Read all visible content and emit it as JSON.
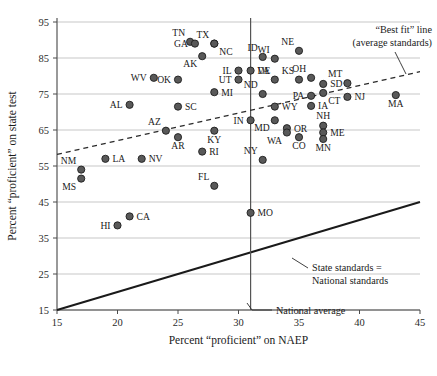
{
  "chart_data": {
    "type": "scatter",
    "title": "",
    "xlabel": "Percent “proficient” on NAEP",
    "ylabel": "Percent “proficient” on state test",
    "xlim": [
      15,
      45
    ],
    "ylim": [
      15,
      95
    ],
    "xticks": [
      15,
      20,
      25,
      30,
      35,
      40,
      45
    ],
    "yticks": [
      15,
      25,
      35,
      45,
      55,
      65,
      75,
      85,
      95
    ],
    "grid": true,
    "legend": "none",
    "national_average_x": 31,
    "points": [
      {
        "label": "TN",
        "x": 26.0,
        "y": 89.5,
        "label_pos": "upper-left"
      },
      {
        "label": "GA",
        "x": 26.4,
        "y": 89.0,
        "label_pos": "left"
      },
      {
        "label": "TX",
        "x": 28.0,
        "y": 89.0,
        "label_pos": "upper-left"
      },
      {
        "label": "NC",
        "x": 28.0,
        "y": 89.0,
        "label_pos": "lower-right"
      },
      {
        "label": "AK",
        "x": 27.0,
        "y": 85.5,
        "label_pos": "lower-left"
      },
      {
        "label": "ID",
        "x": 32.0,
        "y": 85.3,
        "label_pos": "upper-left"
      },
      {
        "label": "WI",
        "x": 33.0,
        "y": 84.8,
        "label_pos": "upper-left"
      },
      {
        "label": "NE",
        "x": 35.0,
        "y": 87.0,
        "label_pos": "upper-left"
      },
      {
        "label": "WV",
        "x": 23.0,
        "y": 79.5,
        "label_pos": "left"
      },
      {
        "label": "OK",
        "x": 25.0,
        "y": 79.0,
        "label_pos": "left"
      },
      {
        "label": "IL",
        "x": 30.0,
        "y": 81.5,
        "label_pos": "left"
      },
      {
        "label": "UT",
        "x": 30.0,
        "y": 79.0,
        "label_pos": "left"
      },
      {
        "label": "DE",
        "x": 31.0,
        "y": 81.5,
        "label_pos": "right"
      },
      {
        "label": "VA",
        "x": 33.0,
        "y": 79.0,
        "label_pos": "upper-left"
      },
      {
        "label": "KS",
        "x": 35.0,
        "y": 79.0,
        "label_pos": "upper-left"
      },
      {
        "label": "OH",
        "x": 36.0,
        "y": 79.5,
        "label_pos": "upper-left"
      },
      {
        "label": "SD",
        "x": 37.0,
        "y": 77.8,
        "label_pos": "right"
      },
      {
        "label": "MT",
        "x": 39.0,
        "y": 78.0,
        "label_pos": "upper-left"
      },
      {
        "label": "MI",
        "x": 28.0,
        "y": 75.5,
        "label_pos": "right"
      },
      {
        "label": "ND",
        "x": 32.0,
        "y": 75.0,
        "label_pos": "upper-left"
      },
      {
        "label": "PA",
        "x": 36.0,
        "y": 74.5,
        "label_pos": "left"
      },
      {
        "label": "CT",
        "x": 37.0,
        "y": 75.3,
        "label_pos": "lower-right"
      },
      {
        "label": "NJ",
        "x": 39.0,
        "y": 74.2,
        "label_pos": "right"
      },
      {
        "label": "MA",
        "x": 43.0,
        "y": 74.7,
        "label_pos": "lower"
      },
      {
        "label": "AL",
        "x": 21.0,
        "y": 72.0,
        "label_pos": "left"
      },
      {
        "label": "SC",
        "x": 25.0,
        "y": 71.5,
        "label_pos": "right"
      },
      {
        "label": "WY",
        "x": 33.0,
        "y": 71.5,
        "label_pos": "right"
      },
      {
        "label": "IA",
        "x": 36.0,
        "y": 71.7,
        "label_pos": "right"
      },
      {
        "label": "IN",
        "x": 31.0,
        "y": 67.7,
        "label_pos": "left"
      },
      {
        "label": "MD",
        "x": 33.0,
        "y": 67.7,
        "label_pos": "lower-left"
      },
      {
        "label": "NH",
        "x": 37.0,
        "y": 66.2,
        "label_pos": "upper"
      },
      {
        "label": "AZ",
        "x": 24.0,
        "y": 64.8,
        "label_pos": "upper-left"
      },
      {
        "label": "KY",
        "x": 28.0,
        "y": 64.8,
        "label_pos": "lower"
      },
      {
        "label": "OR",
        "x": 34.0,
        "y": 65.5,
        "label_pos": "right"
      },
      {
        "label": "WA",
        "x": 34.0,
        "y": 64.3,
        "label_pos": "lower-left"
      },
      {
        "label": "ME",
        "x": 37.0,
        "y": 64.3,
        "label_pos": "right"
      },
      {
        "label": "AR",
        "x": 25.0,
        "y": 63.0,
        "label_pos": "lower"
      },
      {
        "label": "CO",
        "x": 35.0,
        "y": 63.0,
        "label_pos": "lower"
      },
      {
        "label": "MN",
        "x": 37.0,
        "y": 62.5,
        "label_pos": "lower"
      },
      {
        "label": "RI",
        "x": 27.0,
        "y": 59.0,
        "label_pos": "right"
      },
      {
        "label": "NY",
        "x": 32.0,
        "y": 56.7,
        "label_pos": "upper-left"
      },
      {
        "label": "LA",
        "x": 19.0,
        "y": 57.0,
        "label_pos": "right"
      },
      {
        "label": "NV",
        "x": 22.0,
        "y": 57.0,
        "label_pos": "right"
      },
      {
        "label": "NM",
        "x": 17.0,
        "y": 54.0,
        "label_pos": "upper-left"
      },
      {
        "label": "MS",
        "x": 17.0,
        "y": 51.5,
        "label_pos": "lower-left"
      },
      {
        "label": "FL",
        "x": 28.0,
        "y": 49.5,
        "label_pos": "upper-left"
      },
      {
        "label": "CA",
        "x": 21.0,
        "y": 41.0,
        "label_pos": "right"
      },
      {
        "label": "HI",
        "x": 20.0,
        "y": 38.5,
        "label_pos": "left"
      },
      {
        "label": "MO",
        "x": 31.0,
        "y": 42.0,
        "label_pos": "right"
      }
    ],
    "best_fit_line": {
      "x1": 15,
      "y1": 58.2,
      "x2": 45,
      "y2": 81.2
    },
    "identity_line": {
      "x1": 15,
      "y1": 15,
      "x2": 45,
      "y2": 45
    },
    "annotations": [
      {
        "name": "best-fit-annotation",
        "line1": "“Best fit” line",
        "line2": "(average standards)"
      },
      {
        "name": "identity-annotation",
        "line1": "State standards =",
        "line2": "National standards"
      },
      {
        "name": "national-average-annotation",
        "line1": "National average",
        "line2": ""
      }
    ]
  },
  "footer": {
    "caption": ""
  }
}
